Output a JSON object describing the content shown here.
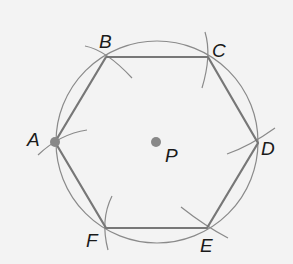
{
  "diagram": {
    "center": {
      "label": "P",
      "x": 156,
      "y": 142
    },
    "circle": {
      "cx": 157,
      "cy": 142,
      "r": 101
    },
    "vertices": [
      {
        "label": "A",
        "x": 55,
        "y": 142
      },
      {
        "label": "B",
        "x": 106,
        "y": 57
      },
      {
        "label": "C",
        "x": 208,
        "y": 57
      },
      {
        "label": "D",
        "x": 258,
        "y": 143
      },
      {
        "label": "E",
        "x": 207,
        "y": 228
      },
      {
        "label": "F",
        "x": 106,
        "y": 228
      }
    ],
    "colors": {
      "background": "#f3f3f3",
      "hexagon": "#777777",
      "circle": "#8a8a8a",
      "arcs": "#8a8a8a",
      "points": "#888888",
      "labels": "#1a1a1a"
    }
  }
}
